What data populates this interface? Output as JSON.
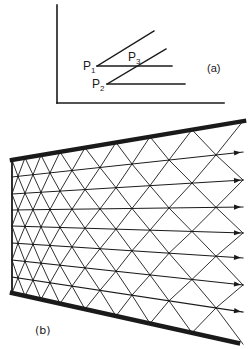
{
  "figure": {
    "stroke_color": "#1a1a1a",
    "background": "#ffffff"
  },
  "panel_a": {
    "label": "(a)",
    "axes": {
      "origin": [
        57,
        103
      ],
      "y_top": 5,
      "x_right": 224
    },
    "points": [
      {
        "name": "P",
        "sub": "1",
        "label_pos": [
          83,
          60
        ],
        "at": [
          97,
          66
        ]
      },
      {
        "name": "P",
        "sub": "2",
        "label_pos": [
          92,
          78
        ],
        "at": [
          107,
          84
        ]
      },
      {
        "name": "P",
        "sub": "3",
        "label_pos": [
          128,
          51
        ],
        "at": [
          135,
          66
        ]
      }
    ],
    "lines": [
      {
        "from": [
          97,
          66
        ],
        "to": [
          172,
          66
        ]
      },
      {
        "from": [
          97,
          66
        ],
        "to": [
          154,
          31
        ]
      },
      {
        "from": [
          107,
          84
        ],
        "to": [
          185,
          84
        ]
      },
      {
        "from": [
          107,
          84
        ],
        "to": [
          166,
          49
        ]
      }
    ],
    "label_pos": [
      207,
      63
    ]
  },
  "panel_b": {
    "label": "(b)",
    "label_pos": [
      35,
      325
    ],
    "walls": {
      "top": {
        "from": [
          12,
          160
        ],
        "to": [
          244,
          121
        ]
      },
      "bottom": {
        "from": [
          12,
          293
        ],
        "to": [
          238,
          343
        ]
      },
      "left": {
        "from": [
          12,
          160
        ],
        "to": [
          12,
          293
        ]
      }
    },
    "rays": [
      {
        "left_y": 177,
        "right_y": 152
      },
      {
        "left_y": 194,
        "right_y": 180
      },
      {
        "left_y": 210,
        "right_y": 207
      },
      {
        "left_y": 226,
        "right_y": 233
      },
      {
        "left_y": 243,
        "right_y": 258
      },
      {
        "left_y": 260,
        "right_y": 285
      },
      {
        "left_y": 277,
        "right_y": 312
      }
    ],
    "ray_end_x": 243,
    "mesh_columns_x": [
      12,
      18,
      25,
      33,
      41,
      50,
      60,
      72,
      85,
      100,
      116,
      132,
      150,
      169,
      192,
      216,
      243
    ]
  }
}
